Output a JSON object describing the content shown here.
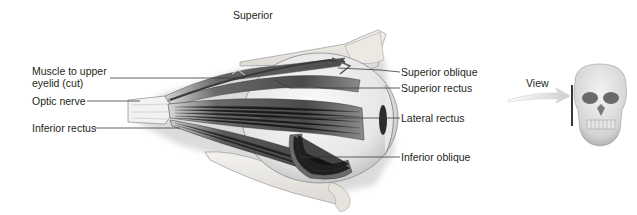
{
  "figure": {
    "orientation_label": "Superior",
    "view_label": "View",
    "colors": {
      "text": "#231f20",
      "leader_line": "#3a3a3a",
      "muscle_dark": "#4a4a4a",
      "muscle_mid": "#8a8a8a",
      "bone": "#e8e6e2",
      "eyeball": "#f2f2f2",
      "arrow": "#d8d8d8"
    }
  },
  "labels_left": [
    {
      "id": "muscle-to-upper-eyelid",
      "text": "Muscle to upper eyelid (cut)"
    },
    {
      "id": "optic-nerve",
      "text": "Optic nerve"
    },
    {
      "id": "inferior-rectus",
      "text": "Inferior rectus"
    }
  ],
  "labels_right": [
    {
      "id": "superior-oblique",
      "text": "Superior oblique"
    },
    {
      "id": "superior-rectus",
      "text": "Superior rectus"
    },
    {
      "id": "lateral-rectus",
      "text": "Lateral rectus"
    },
    {
      "id": "inferior-oblique",
      "text": "Inferior oblique"
    }
  ]
}
